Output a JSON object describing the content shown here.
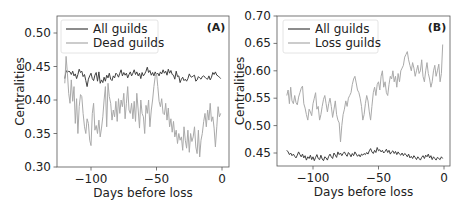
{
  "chart_data": [
    {
      "type": "line",
      "panel_label": "(A)",
      "xlabel": "Days before loss",
      "ylabel": "Centralities",
      "xlim": [
        -125,
        5
      ],
      "ylim": [
        0.3,
        0.52
      ],
      "xticks": [
        -100,
        -50,
        0
      ],
      "xtick_labels": [
        "−100",
        "−50",
        "0"
      ],
      "yticks": [
        0.3,
        0.35,
        0.4,
        0.45,
        0.5
      ],
      "ytick_labels": [
        "0.30",
        "0.35",
        "0.40",
        "0.45",
        "0.50"
      ],
      "legend_position": "upper left",
      "grid": false,
      "x_start": -120,
      "x_end": -1,
      "series": [
        {
          "name": "All guilds",
          "color": "#404040",
          "values": [
            0.432,
            0.444,
            0.441,
            0.443,
            0.442,
            0.438,
            0.443,
            0.436,
            0.439,
            0.432,
            0.438,
            0.446,
            0.441,
            0.443,
            0.435,
            0.438,
            0.429,
            0.42,
            0.431,
            0.436,
            0.44,
            0.432,
            0.429,
            0.437,
            0.441,
            0.428,
            0.442,
            0.425,
            0.43,
            0.426,
            0.434,
            0.428,
            0.437,
            0.433,
            0.44,
            0.431,
            0.429,
            0.436,
            0.433,
            0.44,
            0.438,
            0.434,
            0.44,
            0.445,
            0.436,
            0.441,
            0.437,
            0.44,
            0.433,
            0.438,
            0.442,
            0.436,
            0.44,
            0.445,
            0.438,
            0.442,
            0.436,
            0.44,
            0.432,
            0.441,
            0.436,
            0.439,
            0.443,
            0.449,
            0.441,
            0.444,
            0.437,
            0.441,
            0.436,
            0.442,
            0.438,
            0.44,
            0.436,
            0.442,
            0.439,
            0.445,
            0.44,
            0.443,
            0.437,
            0.446,
            0.44,
            0.444,
            0.438,
            0.437,
            0.431,
            0.443,
            0.435,
            0.436,
            0.426,
            0.431,
            0.434,
            0.429,
            0.431,
            0.428,
            0.432,
            0.439,
            0.435,
            0.434,
            0.436,
            0.437,
            0.428,
            0.43,
            0.435,
            0.433,
            0.431,
            0.435,
            0.436,
            0.434,
            0.432,
            0.431,
            0.436,
            0.43,
            0.434,
            0.441,
            0.438,
            0.442,
            0.437,
            0.436,
            0.434,
            0.432
          ]
        },
        {
          "name": "Dead guilds",
          "color": "#aaaaaa",
          "values": [
            0.425,
            0.465,
            0.44,
            0.41,
            0.395,
            0.43,
            0.398,
            0.42,
            0.365,
            0.402,
            0.35,
            0.39,
            0.408,
            0.405,
            0.38,
            0.36,
            0.35,
            0.372,
            0.365,
            0.34,
            0.332,
            0.38,
            0.395,
            0.355,
            0.362,
            0.35,
            0.37,
            0.345,
            0.358,
            0.375,
            0.4,
            0.42,
            0.36,
            0.425,
            0.405,
            0.395,
            0.37,
            0.385,
            0.375,
            0.398,
            0.368,
            0.402,
            0.38,
            0.4,
            0.39,
            0.41,
            0.372,
            0.395,
            0.42,
            0.385,
            0.38,
            0.395,
            0.372,
            0.398,
            0.368,
            0.41,
            0.385,
            0.358,
            0.4,
            0.38,
            0.375,
            0.35,
            0.392,
            0.38,
            0.4,
            0.36,
            0.385,
            0.4,
            0.42,
            0.435,
            0.44,
            0.42,
            0.398,
            0.39,
            0.402,
            0.38,
            0.378,
            0.395,
            0.37,
            0.388,
            0.36,
            0.372,
            0.352,
            0.368,
            0.345,
            0.355,
            0.335,
            0.35,
            0.34,
            0.345,
            0.325,
            0.36,
            0.34,
            0.328,
            0.355,
            0.322,
            0.35,
            0.338,
            0.345,
            0.36,
            0.33,
            0.32,
            0.355,
            0.315,
            0.34,
            0.35,
            0.368,
            0.38,
            0.36,
            0.385,
            0.37,
            0.395,
            0.368,
            0.375,
            0.358,
            0.33,
            0.36,
            0.39,
            0.375,
            0.38
          ]
        }
      ]
    },
    {
      "type": "line",
      "panel_label": "(B)",
      "xlabel": "Days before loss",
      "ylabel": "Centralities",
      "xlim": [
        -125,
        5
      ],
      "ylim": [
        0.425,
        0.7
      ],
      "xticks": [
        -100,
        -50,
        0
      ],
      "xtick_labels": [
        "−100",
        "−50",
        "0"
      ],
      "yticks": [
        0.45,
        0.5,
        0.55,
        0.6,
        0.65,
        0.7
      ],
      "ytick_labels": [
        "0.45",
        "0.50",
        "0.55",
        "0.60",
        "0.65",
        "0.70"
      ],
      "legend_position": "upper left",
      "grid": false,
      "x_start": -120,
      "x_end": -1,
      "series": [
        {
          "name": "All guilds",
          "color": "#404040",
          "values": [
            0.455,
            0.452,
            0.447,
            0.45,
            0.445,
            0.448,
            0.444,
            0.441,
            0.446,
            0.452,
            0.447,
            0.443,
            0.448,
            0.441,
            0.445,
            0.437,
            0.443,
            0.44,
            0.446,
            0.438,
            0.443,
            0.436,
            0.442,
            0.447,
            0.44,
            0.438,
            0.446,
            0.439,
            0.436,
            0.443,
            0.441,
            0.437,
            0.444,
            0.448,
            0.443,
            0.44,
            0.45,
            0.446,
            0.442,
            0.452,
            0.447,
            0.45,
            0.445,
            0.449,
            0.452,
            0.447,
            0.444,
            0.451,
            0.448,
            0.443,
            0.449,
            0.445,
            0.452,
            0.448,
            0.444,
            0.447,
            0.443,
            0.448,
            0.446,
            0.449,
            0.447,
            0.451,
            0.448,
            0.454,
            0.458,
            0.452,
            0.449,
            0.455,
            0.451,
            0.46,
            0.454,
            0.456,
            0.452,
            0.455,
            0.45,
            0.453,
            0.457,
            0.451,
            0.455,
            0.448,
            0.452,
            0.454,
            0.449,
            0.453,
            0.447,
            0.452,
            0.448,
            0.446,
            0.45,
            0.445,
            0.449,
            0.447,
            0.443,
            0.448,
            0.441,
            0.444,
            0.44,
            0.445,
            0.442,
            0.438,
            0.443,
            0.44,
            0.437,
            0.442,
            0.445,
            0.44,
            0.446,
            0.443,
            0.448,
            0.441,
            0.445,
            0.438,
            0.443,
            0.44,
            0.437,
            0.442,
            0.44,
            0.438,
            0.443,
            0.44
          ]
        },
        {
          "name": "Loss guilds",
          "color": "#aaaaaa",
          "values": [
            0.555,
            0.565,
            0.54,
            0.57,
            0.545,
            0.54,
            0.555,
            0.542,
            0.538,
            0.552,
            0.56,
            0.568,
            0.572,
            0.54,
            0.532,
            0.52,
            0.51,
            0.53,
            0.525,
            0.518,
            0.54,
            0.55,
            0.56,
            0.53,
            0.535,
            0.51,
            0.52,
            0.535,
            0.548,
            0.555,
            0.54,
            0.525,
            0.54,
            0.55,
            0.535,
            0.515,
            0.53,
            0.545,
            0.52,
            0.51,
            0.505,
            0.47,
            0.5,
            0.52,
            0.53,
            0.545,
            0.535,
            0.55,
            0.555,
            0.56,
            0.575,
            0.585,
            0.59,
            0.578,
            0.565,
            0.56,
            0.55,
            0.535,
            0.51,
            0.52,
            0.54,
            0.555,
            0.545,
            0.525,
            0.51,
            0.535,
            0.56,
            0.57,
            0.555,
            0.575,
            0.58,
            0.565,
            0.59,
            0.6,
            0.57,
            0.58,
            0.56,
            0.555,
            0.575,
            0.59,
            0.585,
            0.6,
            0.58,
            0.59,
            0.57,
            0.595,
            0.58,
            0.6,
            0.605,
            0.61,
            0.625,
            0.63,
            0.635,
            0.62,
            0.61,
            0.6,
            0.615,
            0.605,
            0.59,
            0.6,
            0.61,
            0.595,
            0.6,
            0.62,
            0.59,
            0.58,
            0.6,
            0.615,
            0.595,
            0.585,
            0.57,
            0.58,
            0.6,
            0.61,
            0.59,
            0.6,
            0.612,
            0.58,
            0.595,
            0.648
          ]
        }
      ]
    }
  ]
}
